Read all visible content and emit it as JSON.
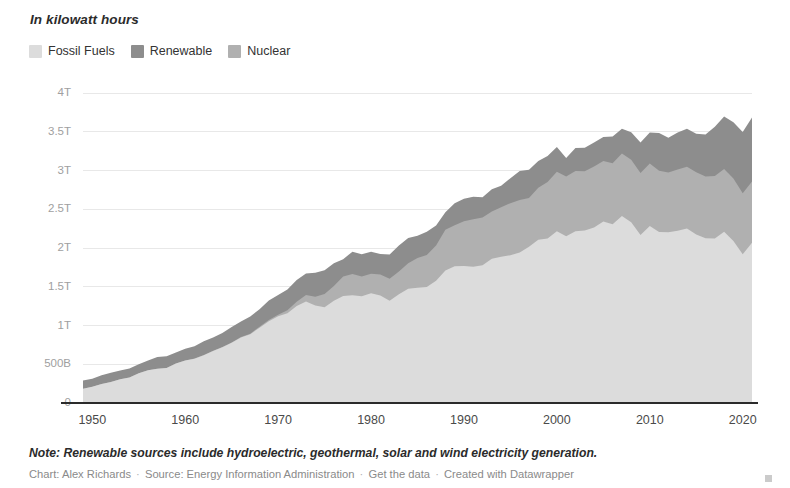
{
  "header": {
    "subtitle": "In kilowatt hours"
  },
  "legend": {
    "position": "top-left",
    "items": [
      {
        "label": "Fossil Fuels",
        "color": "#dcdcdc",
        "name": "legend-item-fossil-fuels"
      },
      {
        "label": "Renewable",
        "color": "#8d8d8d",
        "name": "legend-item-renewable"
      },
      {
        "label": "Nuclear",
        "color": "#b0b0b0",
        "name": "legend-item-nuclear"
      }
    ]
  },
  "footer": {
    "note": "Note: Renewable sources include hydroelectric, geothermal, solar and wind electricity generation.",
    "credit_chart": "Chart: Alex Richards",
    "credit_source": "Source: Energy Information Administration",
    "credit_data_link": "Get the data",
    "credit_tool": "Created with Datawrapper",
    "separator": "·"
  },
  "chart_data": {
    "type": "area",
    "stacked": true,
    "title": "",
    "subtitle": "In kilowatt hours",
    "xlabel": "",
    "ylabel": "",
    "grid": true,
    "legend_position": "top-left",
    "xlim": [
      1949,
      2021
    ],
    "ylim": [
      0,
      4000
    ],
    "y_unit": "billion kilowatt hours",
    "y_tick_values": [
      0,
      500,
      1000,
      1500,
      2000,
      2500,
      3000,
      3500,
      4000
    ],
    "y_tick_labels": [
      "0",
      "500B",
      "1T",
      "1.5T",
      "2T",
      "2.5T",
      "3T",
      "3.5T",
      "4T"
    ],
    "x_tick_values": [
      1950,
      1960,
      1970,
      1980,
      1990,
      2000,
      2010,
      2020
    ],
    "x_tick_labels": [
      "1950",
      "1960",
      "1970",
      "1980",
      "1990",
      "2000",
      "2010",
      "2020"
    ],
    "x": [
      1949,
      1950,
      1951,
      1952,
      1953,
      1954,
      1955,
      1956,
      1957,
      1958,
      1959,
      1960,
      1961,
      1962,
      1963,
      1964,
      1965,
      1966,
      1967,
      1968,
      1969,
      1970,
      1971,
      1972,
      1973,
      1974,
      1975,
      1976,
      1977,
      1978,
      1979,
      1980,
      1981,
      1982,
      1983,
      1984,
      1985,
      1986,
      1987,
      1988,
      1989,
      1990,
      1991,
      1992,
      1993,
      1994,
      1995,
      1996,
      1997,
      1998,
      1999,
      2000,
      2001,
      2002,
      2003,
      2004,
      2005,
      2006,
      2007,
      2008,
      2009,
      2010,
      2011,
      2012,
      2013,
      2014,
      2015,
      2016,
      2017,
      2018,
      2019,
      2020,
      2021
    ],
    "series": [
      {
        "name": "Fossil Fuels",
        "color": "#dcdcdc",
        "stack_order": 1,
        "values": [
          184,
          211,
          246,
          270,
          306,
          329,
          383,
          421,
          441,
          452,
          509,
          549,
          572,
          616,
          670,
          719,
          776,
          846,
          887,
          972,
          1056,
          1118,
          1158,
          1253,
          1310,
          1257,
          1235,
          1320,
          1380,
          1390,
          1377,
          1416,
          1386,
          1320,
          1404,
          1474,
          1486,
          1496,
          1576,
          1709,
          1766,
          1767,
          1759,
          1776,
          1861,
          1887,
          1906,
          1943,
          2016,
          2105,
          2123,
          2216,
          2153,
          2215,
          2226,
          2263,
          2341,
          2308,
          2414,
          2332,
          2169,
          2283,
          2207,
          2204,
          2224,
          2251,
          2174,
          2126,
          2123,
          2211,
          2089,
          1918,
          2067
        ]
      },
      {
        "name": "Nuclear",
        "color": "#b0b0b0",
        "stack_order": 2,
        "values": [
          0,
          0,
          0,
          0,
          0,
          0,
          0,
          0,
          0,
          0,
          0.2,
          0.5,
          1.7,
          2.3,
          3.2,
          3.3,
          3.7,
          5.5,
          7.7,
          12.5,
          13.9,
          21.8,
          38.1,
          54.1,
          83.5,
          114,
          173,
          191,
          251,
          276,
          255,
          251,
          273,
          283,
          294,
          328,
          384,
          414,
          455,
          527,
          529,
          577,
          613,
          619,
          610,
          640,
          673,
          675,
          629,
          674,
          728,
          769,
          769,
          780,
          764,
          788,
          782,
          787,
          806,
          806,
          799,
          807,
          790,
          769,
          789,
          797,
          805,
          798,
          807,
          807,
          809,
          790,
          790
        ]
      },
      {
        "name": "Renewable",
        "color": "#8d8d8d",
        "stack_order": 3,
        "values": [
          106,
          101,
          111,
          121,
          114,
          115,
          117,
          128,
          153,
          152,
          142,
          150,
          158,
          177,
          173,
          181,
          200,
          199,
          223,
          225,
          252,
          254,
          270,
          279,
          276,
          309,
          305,
          291,
          225,
          287,
          286,
          284,
          263,
          312,
          334,
          327,
          288,
          301,
          258,
          226,
          281,
          292,
          288,
          259,
          287,
          277,
          321,
          376,
          365,
          344,
          337,
          319,
          238,
          294,
          302,
          311,
          309,
          344,
          320,
          355,
          392,
          400,
          486,
          448,
          477,
          491,
          495,
          542,
          634,
          679,
          723,
          788,
          826
        ]
      }
    ],
    "annotations": [],
    "note": "Note: Renewable sources include hydroelectric, geothermal, solar and wind electricity generation."
  }
}
